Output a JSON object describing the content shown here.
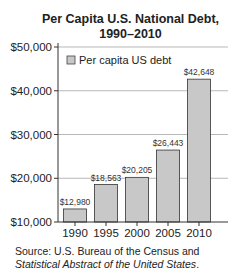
{
  "chart_data": {
    "type": "bar",
    "title": "Per Capita U.S. National Debt, 1990–2010",
    "title_lines": [
      "Per Capita U.S. National Debt,",
      "1990–2010"
    ],
    "xlabel": "",
    "ylabel": "",
    "categories": [
      "1990",
      "1995",
      "2000",
      "2005",
      "2010"
    ],
    "values": [
      12980,
      18563,
      20205,
      26443,
      42648
    ],
    "data_labels": [
      "$12,980",
      "$18,563",
      "$20,205",
      "$26,443",
      "$42,648"
    ],
    "series": [
      {
        "name": "Per capita US debt",
        "values": [
          12980,
          18563,
          20205,
          26443,
          42648
        ]
      }
    ],
    "ylim": [
      10000,
      50000
    ],
    "y_ticks": [
      10000,
      20000,
      30000,
      40000,
      50000
    ],
    "y_tick_labels": [
      "$10,000",
      "$20,000",
      "$30,000",
      "$40,000",
      "$50,000"
    ],
    "grid": true,
    "legend": {
      "position": "top-left inside",
      "entries": [
        "Per capita US debt"
      ]
    },
    "bar_color": "#c8c8c8",
    "bar_edge_color": "#333333",
    "grid_color": "#b8b8b8"
  },
  "source": {
    "prefix": "Source: U.S. Bureau of the Census and ",
    "italic": "Statistical Abstract of the United States",
    "suffix": "."
  }
}
